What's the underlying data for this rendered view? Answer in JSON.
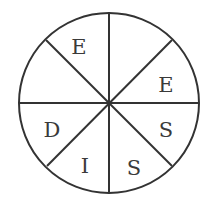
{
  "diagram": {
    "type": "spinner",
    "sections": 8,
    "labels": [
      {
        "position": "top-left-upper",
        "text": "E"
      },
      {
        "position": "right-upper",
        "text": "E"
      },
      {
        "position": "right-lower",
        "text": "S"
      },
      {
        "position": "bottom-right",
        "text": "S"
      },
      {
        "position": "bottom-left",
        "text": "I"
      },
      {
        "position": "left-lower",
        "text": "D"
      },
      {
        "position": "left-upper",
        "text": ""
      },
      {
        "position": "top-right",
        "text": ""
      }
    ],
    "colors": {
      "line": "#333333",
      "text": "#3a3a3a",
      "background": "#ffffff"
    }
  }
}
